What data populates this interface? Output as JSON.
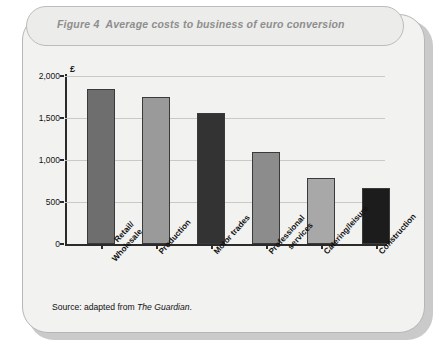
{
  "figure": {
    "number": "Figure 4",
    "title": "Average costs to business of euro conversion",
    "source_prefix": "Source: adapted from ",
    "source_publication": "The Guardian",
    "source_suffix": "."
  },
  "chart_data": {
    "type": "bar",
    "title": "Average costs to business of euro conversion",
    "xlabel": "",
    "ylabel": "£",
    "ylim": [
      0,
      2000
    ],
    "yticks": [
      0,
      500,
      1000,
      1500,
      2000
    ],
    "ytick_labels": [
      "0",
      "500",
      "1,000",
      "1,500",
      "2,000"
    ],
    "grid": true,
    "legend": "none",
    "categories": [
      "Retail/\nWholesale",
      "Production",
      "Motor trades",
      "Professional\nservices",
      "Catering/leisure",
      "Construction"
    ],
    "category_lines": [
      [
        "Retail/",
        "Wholesale"
      ],
      [
        "Production"
      ],
      [
        "Motor trades"
      ],
      [
        "Professional",
        "services"
      ],
      [
        "Catering/leisure"
      ],
      [
        "Construction"
      ]
    ],
    "values": [
      1850,
      1750,
      1560,
      1100,
      790,
      670
    ],
    "bar_colors": [
      "#6e6e6e",
      "#9a9a9a",
      "#333333",
      "#8c8c8c",
      "#a8a8a8",
      "#1c1c1c"
    ]
  }
}
